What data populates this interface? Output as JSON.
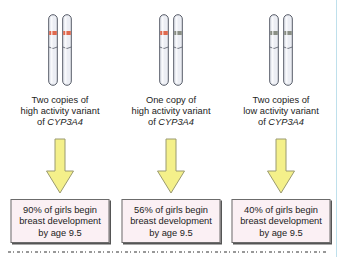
{
  "figure": {
    "panels": [
      {
        "label_lines": [
          "Two copies of",
          "high activity variant",
          "of "
        ],
        "gene": "CYP3A4",
        "band_colors": [
          "#e0694e",
          "#e0694e"
        ],
        "result_lines": [
          "90% of girls begin",
          "breast development",
          "by age 9.5"
        ]
      },
      {
        "label_lines": [
          "One copy of",
          "high activity variant",
          "of "
        ],
        "gene": "CYP3A4",
        "band_colors": [
          "#e0694e",
          "#8a8f85"
        ],
        "result_lines": [
          "56% of girls begin",
          "breast development",
          "by age 9.5"
        ]
      },
      {
        "label_lines": [
          "Two copies of",
          "low activity variant",
          "of "
        ],
        "gene": "CYP3A4",
        "band_colors": [
          "#8a8f85",
          "#8a8f85"
        ],
        "result_lines": [
          "40% of girls begin",
          "breast development",
          "by age 9.5"
        ]
      }
    ],
    "colors": {
      "arrow_fill": "#f4f08a",
      "arrow_stroke": "#9a9a70",
      "box_fill": "#fbf0f4",
      "box_border": "#6b6b6b",
      "chromosome_fill": "#eceef4",
      "chromosome_stroke": "#555a66"
    }
  }
}
